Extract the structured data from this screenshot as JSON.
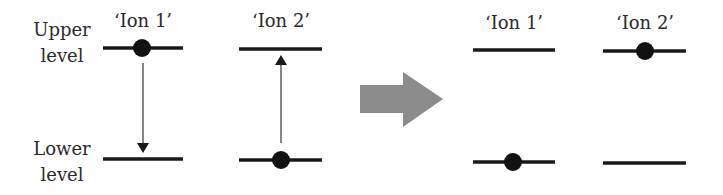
{
  "labels": {
    "upper_line1": "Upper",
    "upper_line2": "level",
    "lower_line1": "Lower",
    "lower_line2": "level"
  },
  "before": {
    "ion1": {
      "title": "‘Ion 1’",
      "particle_level": "upper",
      "transition": "down"
    },
    "ion2": {
      "title": "‘Ion 2’",
      "particle_level": "lower",
      "transition": "up"
    }
  },
  "after": {
    "ion1": {
      "title": "‘Ion 1’",
      "particle_level": "lower"
    },
    "ion2": {
      "title": "‘Ion 2’",
      "particle_level": "upper"
    }
  },
  "colors": {
    "level_line": "#1a1a1a",
    "particle": "#111111",
    "process_arrow": "#8c8c8c"
  }
}
